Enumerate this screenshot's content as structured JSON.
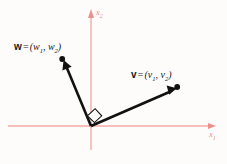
{
  "figure": {
    "name": "orthogonal-vectors-diagram",
    "background_color": "#fdfcfa",
    "axis_color": "#f0a9a4",
    "vector_color": "#111111",
    "axes": {
      "x_axis": {
        "label_name": "x",
        "label_sub": "1",
        "icon": "arrow-right-icon"
      },
      "y_axis": {
        "label_name": "x",
        "label_sub": "2",
        "icon": "arrow-up-icon"
      },
      "origin": {
        "x": 91,
        "y": 126
      }
    },
    "vectors": [
      {
        "key": "w",
        "name": "w",
        "equals": "=",
        "open_paren": "(",
        "comp1": "w",
        "comp1_sub": "1",
        "comma": ",",
        "comp2": "w",
        "comp2_sub": "2",
        "close_paren": ")",
        "tip": {
          "x": 62,
          "y": 59
        }
      },
      {
        "key": "v",
        "name": "v",
        "equals": "=",
        "open_paren": "(",
        "comp1": "v",
        "comp1_sub": "1",
        "comma": ",",
        "comp2": "v",
        "comp2_sub": "2",
        "close_paren": ")",
        "tip": {
          "x": 177,
          "y": 87
        }
      }
    ],
    "right_angle_marker": {
      "name": "right-angle-marker",
      "present": true
    }
  }
}
